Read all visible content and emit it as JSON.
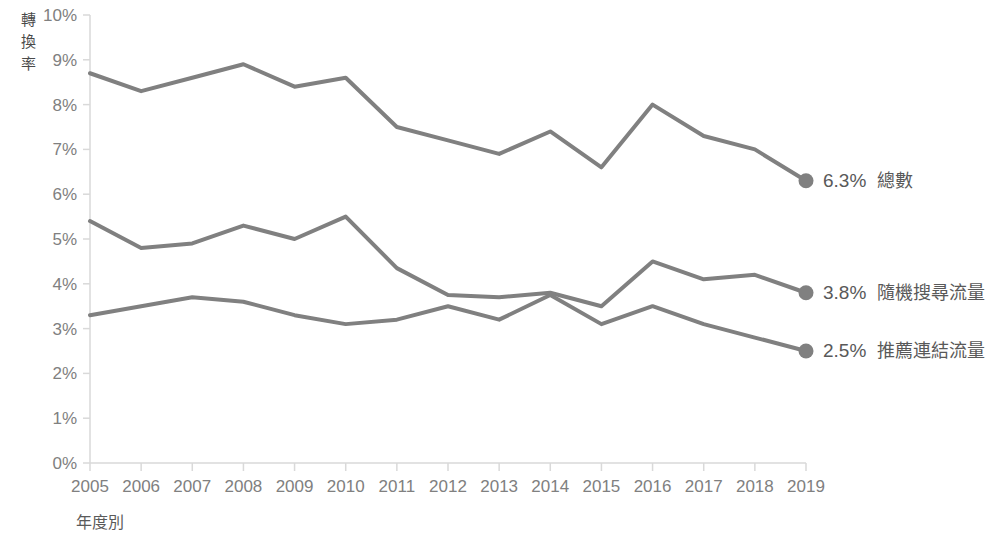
{
  "chart_data": {
    "type": "line",
    "title": "",
    "xlabel": "年度別",
    "ylabel": "轉換率",
    "ylabel_chars": [
      "轉",
      "換",
      "率"
    ],
    "categories": [
      "2005",
      "2006",
      "2007",
      "2008",
      "2009",
      "2010",
      "2011",
      "2012",
      "2013",
      "2014",
      "2015",
      "2016",
      "2017",
      "2018",
      "2019"
    ],
    "x": [
      2005,
      2006,
      2007,
      2008,
      2009,
      2010,
      2011,
      2012,
      2013,
      2014,
      2015,
      2016,
      2017,
      2018,
      2019
    ],
    "ylim": [
      0,
      10
    ],
    "ytick_labels": [
      "0%",
      "1%",
      "2%",
      "3%",
      "4%",
      "5%",
      "6%",
      "7%",
      "8%",
      "9%",
      "10%"
    ],
    "ytick_values": [
      0,
      1,
      2,
      3,
      4,
      5,
      6,
      7,
      8,
      9,
      10
    ],
    "grid": false,
    "legend_position": "right-inline",
    "series": [
      {
        "name": "總數",
        "end_value_label": "6.3%",
        "color": "#808080",
        "values": [
          8.7,
          8.3,
          8.6,
          8.9,
          8.4,
          8.6,
          7.5,
          7.2,
          6.9,
          7.4,
          6.6,
          8.0,
          7.3,
          7.0,
          6.3
        ]
      },
      {
        "name": "隨機搜尋流量",
        "end_value_label": "3.8%",
        "color": "#808080",
        "values": [
          5.4,
          4.8,
          4.9,
          5.3,
          5.0,
          5.5,
          4.35,
          3.75,
          3.7,
          3.8,
          3.5,
          4.5,
          4.1,
          4.2,
          3.8
        ]
      },
      {
        "name": "推薦連結流量",
        "end_value_label": "2.5%",
        "color": "#808080",
        "values": [
          3.3,
          3.5,
          3.7,
          3.6,
          3.3,
          3.1,
          3.2,
          3.5,
          3.2,
          3.75,
          3.1,
          3.5,
          3.1,
          2.8,
          2.5
        ]
      }
    ]
  },
  "colors": {
    "line": "#808080",
    "axis": "#d9d9d9",
    "tick_text": "#808080",
    "label_text": "#595959"
  }
}
